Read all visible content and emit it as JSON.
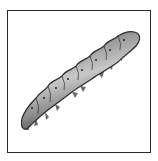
{
  "image": {
    "subject": "caterpillar",
    "description": "Grayscale illustration of a segmented caterpillar (larva) crawling diagonally from lower-left to upper-right inside a thin black square frame",
    "alt_text": "caterpillar illustration"
  },
  "frame": {
    "border_color": "#2a2a2a",
    "background": "#ffffff"
  },
  "colors": {
    "body_dark": "#3a3a3a",
    "body_mid": "#8a8a8a",
    "body_light": "#c8c8c8",
    "spiracle": "#222222"
  }
}
